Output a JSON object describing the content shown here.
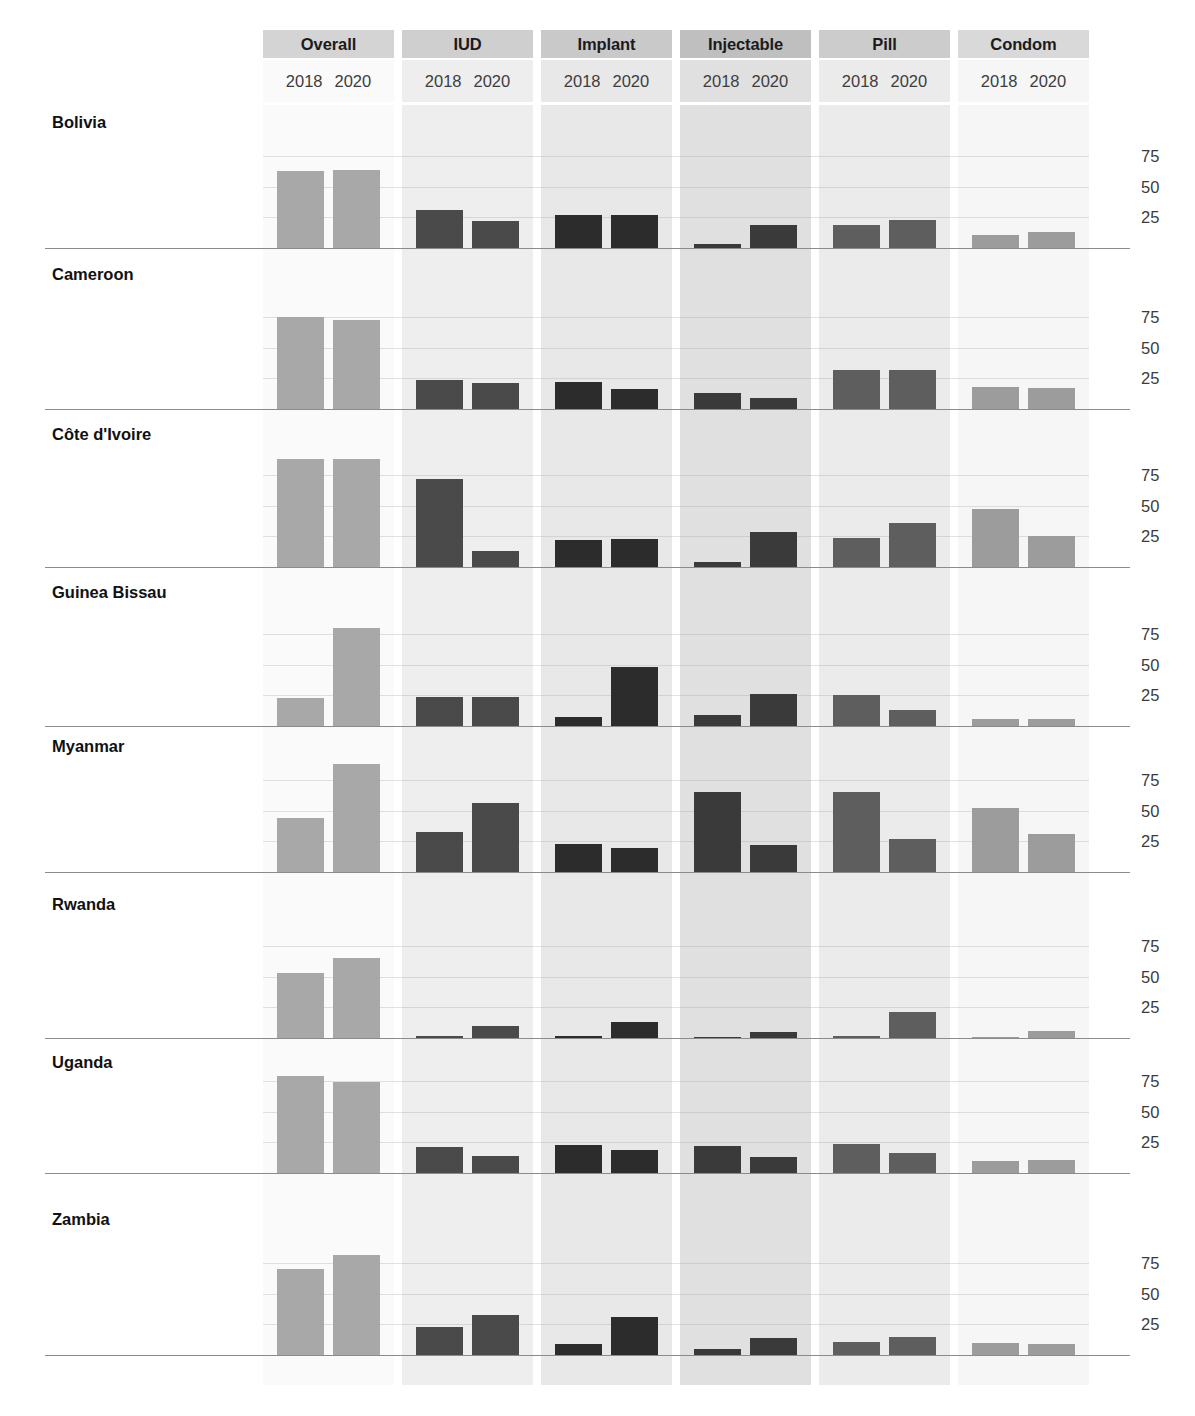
{
  "chart_data": {
    "type": "bar",
    "title": "",
    "subtitle": "",
    "xlabel": "",
    "ylabel": "",
    "ylim": [
      0,
      100
    ],
    "y_ticks": [
      25,
      50,
      75
    ],
    "grid": true,
    "legend_position": "none",
    "layout": "facet grid: rows = country, columns = contraceptive method, x = survey year",
    "facet_columns": [
      "Overall",
      "IUD",
      "Implant",
      "Injectable",
      "Pill",
      "Condom"
    ],
    "facet_rows": [
      "Bolivia",
      "Cameroon",
      "Côte d'Ivoire",
      "Guinea Bissau",
      "Myanmar",
      "Rwanda",
      "Uganda",
      "Zambia"
    ],
    "x_categories": [
      "2018",
      "2020"
    ],
    "series": [
      {
        "name": "2018",
        "color": "#a6a6a6"
      },
      {
        "name": "2020",
        "color": "#a6a6a6"
      }
    ],
    "column_colors": {
      "Overall": "#a8a8a8",
      "IUD": "#4a4a4a",
      "Implant": "#2c2c2c",
      "Injectable": "#3a3a3a",
      "Pill": "#5e5e5e",
      "Condom": "#9c9c9c"
    },
    "column_backgrounds": {
      "Overall": "#fafafa",
      "IUD": "#eeeeee",
      "Implant": "#e8e8e8",
      "Injectable": "#e0e0e0",
      "Pill": "#ebebeb",
      "Condom": "#f6f6f6"
    },
    "column_header_backgrounds": {
      "Overall": "#d4d4d4",
      "IUD": "#cfcfcf",
      "Implant": "#c9c9c9",
      "Injectable": "#bfbfbf",
      "Pill": "#cccccc",
      "Condom": "#d9d9d9"
    },
    "values": {
      "Bolivia": {
        "Overall": [
          63,
          64
        ],
        "IUD": [
          31,
          22
        ],
        "Implant": [
          27,
          27
        ],
        "Injectable": [
          3,
          19
        ],
        "Pill": [
          19,
          23
        ],
        "Condom": [
          11,
          13
        ]
      },
      "Cameroon": {
        "Overall": [
          75,
          73
        ],
        "IUD": [
          24,
          21
        ],
        "Implant": [
          22,
          16
        ],
        "Injectable": [
          13,
          9
        ],
        "Pill": [
          32,
          32
        ],
        "Condom": [
          18,
          17
        ]
      },
      "Côte d'Ivoire": {
        "Overall": [
          88,
          88
        ],
        "IUD": [
          72,
          13
        ],
        "Implant": [
          22,
          23
        ],
        "Injectable": [
          4,
          29
        ],
        "Pill": [
          24,
          36
        ],
        "Condom": [
          47,
          25
        ]
      },
      "Guinea Bissau": {
        "Overall": [
          23,
          80
        ],
        "IUD": [
          24,
          24
        ],
        "Implant": [
          7,
          48
        ],
        "Injectable": [
          9,
          26
        ],
        "Pill": [
          25,
          13
        ],
        "Condom": [
          6,
          6
        ]
      },
      "Myanmar": {
        "Overall": [
          44,
          88
        ],
        "IUD": [
          33,
          56
        ],
        "Implant": [
          23,
          20
        ],
        "Injectable": [
          65,
          22
        ],
        "Pill": [
          65,
          27
        ],
        "Condom": [
          52,
          31
        ]
      },
      "Rwanda": {
        "Overall": [
          53,
          65
        ],
        "IUD": [
          1,
          10
        ],
        "Implant": [
          2,
          13
        ],
        "Injectable": [
          0,
          5
        ],
        "Pill": [
          1,
          21
        ],
        "Condom": [
          0,
          6
        ]
      },
      "Uganda": {
        "Overall": [
          79,
          74
        ],
        "IUD": [
          21,
          14
        ],
        "Implant": [
          23,
          19
        ],
        "Injectable": [
          22,
          13
        ],
        "Pill": [
          24,
          16
        ],
        "Condom": [
          10,
          11
        ]
      },
      "Zambia": {
        "Overall": [
          70,
          82
        ],
        "IUD": [
          23,
          33
        ],
        "Implant": [
          9,
          31
        ],
        "Injectable": [
          5,
          14
        ],
        "Pill": [
          11,
          15
        ],
        "Condom": [
          10,
          9
        ]
      }
    }
  },
  "axis": {
    "tick_labels": [
      "75",
      "50",
      "25"
    ]
  }
}
